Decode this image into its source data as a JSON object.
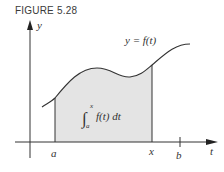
{
  "figure": {
    "label": "FIGURE 5.28",
    "curve_label": "y = f(t)",
    "integral_label": {
      "lower": "a",
      "upper": "x",
      "integrand": "f(t) dt"
    },
    "axes": {
      "y_label": "y",
      "x_label": "t"
    },
    "tick_labels": {
      "a": "a",
      "x": "x",
      "b": "b"
    },
    "colors": {
      "shade": "#e4e4e4",
      "line": "#333333"
    }
  }
}
